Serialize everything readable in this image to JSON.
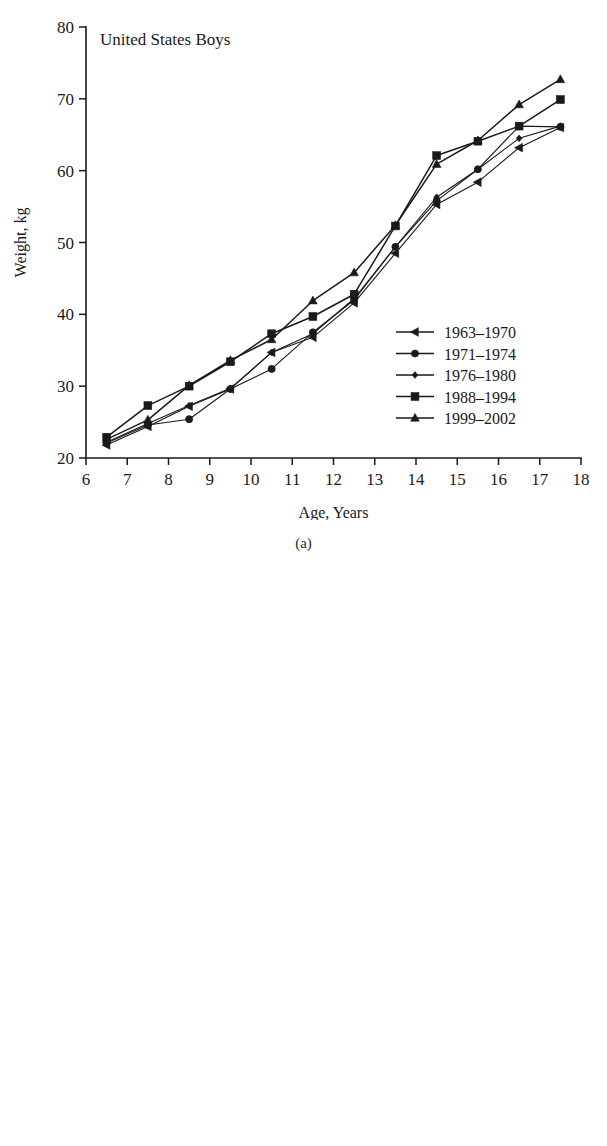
{
  "figure": {
    "panels": [
      {
        "caption": "(a)"
      },
      {
        "caption": "(b)"
      }
    ]
  },
  "chart_data": [
    {
      "type": "line",
      "title": "United States Boys",
      "xlabel": "Age, Years",
      "ylabel": "Weight, kg",
      "xlim": [
        6,
        18
      ],
      "ylim": [
        20,
        80
      ],
      "xticks": [
        6,
        7,
        8,
        9,
        10,
        11,
        12,
        13,
        14,
        15,
        16,
        17,
        18
      ],
      "yticks": [
        20,
        30,
        40,
        50,
        60,
        70,
        80
      ],
      "xtick_labels": [
        "6",
        "7",
        "8",
        "9",
        "10",
        "11",
        "12",
        "13",
        "14",
        "15",
        "16",
        "17",
        "18"
      ],
      "ytick_labels": [
        "20",
        "30",
        "40",
        "50",
        "60",
        "70",
        "80"
      ],
      "grid": false,
      "legend_position": "lower-right",
      "x": [
        6.5,
        7.5,
        8.5,
        9.5,
        10.5,
        11.5,
        12.5,
        13.5,
        14.5,
        15.5,
        16.5,
        17.5
      ],
      "series": [
        {
          "name": "1963–1970",
          "marker": "triangle-left",
          "values": [
            21.8,
            24.4,
            27.2,
            29.6,
            34.7,
            36.8,
            41.6,
            48.5,
            55.3,
            58.4,
            63.2,
            66.0
          ]
        },
        {
          "name": "1971–1974",
          "marker": "circle",
          "values": [
            22.1,
            24.6,
            25.4,
            29.6,
            32.4,
            37.5,
            42.0,
            49.4,
            55.8,
            60.2,
            66.2,
            66.1
          ]
        },
        {
          "name": "1976–1980",
          "marker": "diamond",
          "values": [
            22.2,
            24.8,
            27.3,
            29.7,
            34.7,
            37.3,
            42.2,
            49.4,
            56.3,
            60.2,
            64.5,
            66.2
          ]
        },
        {
          "name": "1988–1994",
          "marker": "square",
          "values": [
            22.9,
            27.3,
            30.0,
            33.4,
            37.3,
            39.7,
            42.8,
            52.3,
            62.1,
            64.1,
            66.2,
            69.9
          ]
        },
        {
          "name": "1999–2002",
          "marker": "triangle-up",
          "values": [
            22.6,
            25.3,
            30.1,
            33.6,
            36.5,
            41.9,
            45.8,
            52.4,
            60.9,
            64.2,
            69.2,
            72.7
          ]
        }
      ]
    },
    {
      "type": "line",
      "title": "United States Boys",
      "xlabel": "Age, Years",
      "ylabel": "Weight, kg",
      "xlim": [
        6,
        18
      ],
      "ylim": [
        20,
        80
      ],
      "xticks": [
        6,
        7,
        8,
        9,
        10,
        11,
        12,
        13,
        14,
        15,
        16,
        17,
        18
      ],
      "yticks": [
        20,
        30,
        40,
        50,
        60,
        70,
        80
      ],
      "xtick_labels": [
        "6",
        "7",
        "8",
        "9",
        "10",
        "11",
        "12",
        "13",
        "14",
        "15",
        "16",
        "17",
        "18"
      ],
      "ytick_labels": [
        "20",
        "30",
        "40",
        "50",
        "60",
        "70",
        "80"
      ],
      "grid": false,
      "legend_position": "lower-right",
      "x": [
        6.5,
        7.5,
        8.5,
        9.5,
        10.5,
        11.5,
        12.5,
        13.5,
        14.5,
        15.5,
        16.5,
        17.5
      ],
      "series": [
        {
          "name": "1963–1970",
          "marker": "triangle-left",
          "values": [
            21.8,
            24.4,
            27.2,
            29.6,
            34.7,
            36.8,
            41.6,
            48.5,
            55.3,
            58.4,
            63.2,
            66.0
          ]
        },
        {
          "name": "1971–1974",
          "marker": "circle",
          "values": [
            22.1,
            24.6,
            25.4,
            29.6,
            32.4,
            37.5,
            42.0,
            49.4,
            55.8,
            60.2,
            66.2,
            66.1
          ]
        },
        {
          "name": "1976–1980",
          "marker": "diamond",
          "values": [
            22.2,
            24.8,
            27.3,
            29.7,
            34.7,
            37.3,
            42.2,
            49.4,
            56.3,
            60.2,
            64.5,
            66.2
          ]
        },
        {
          "name": "1988–1994",
          "marker": "square",
          "values": [
            22.9,
            27.3,
            30.0,
            33.4,
            37.3,
            39.7,
            42.8,
            52.3,
            62.1,
            64.1,
            66.2,
            69.9
          ]
        },
        {
          "name": "1999–2002",
          "marker": "triangle-up",
          "values": [
            22.6,
            25.3,
            30.1,
            33.6,
            36.5,
            41.9,
            45.8,
            52.4,
            60.9,
            64.2,
            69.2,
            72.7
          ]
        }
      ]
    }
  ]
}
